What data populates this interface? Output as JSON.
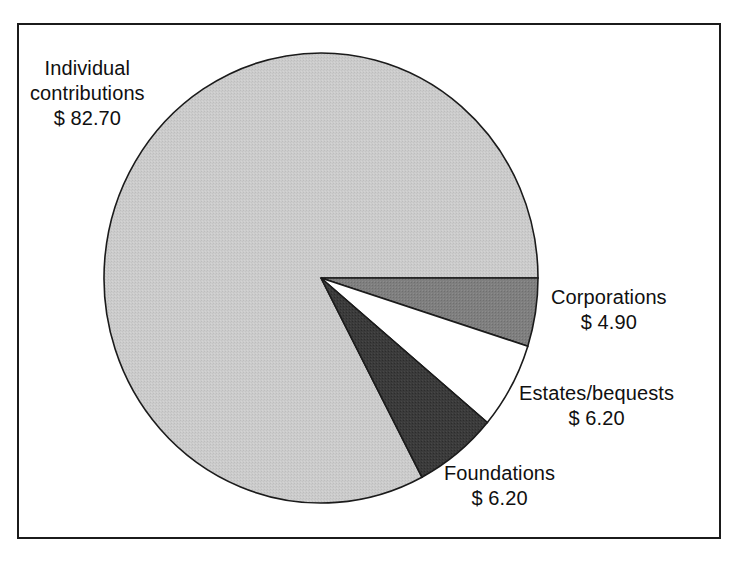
{
  "figure": {
    "background_color": "#ffffff",
    "border_color": "#1b1b1b"
  },
  "chart_data": {
    "type": "pie",
    "title": "",
    "subtitle": "",
    "xlabel": "",
    "ylabel": "",
    "grid": false,
    "legend_position": "none",
    "units": "$ (billions)",
    "total": 100.0,
    "start_angle_deg": 0,
    "direction": "clockwise",
    "categories": [
      "Individual contributions",
      "Corporations",
      "Estates/bequests",
      "Foundations"
    ],
    "values": [
      82.7,
      4.9,
      6.2,
      6.2
    ],
    "value_labels": [
      "$ 82.70",
      "$ 4.90",
      "$ 6.20",
      "$ 6.20"
    ],
    "colors": [
      "#c9c9c9",
      "#7f7f7f",
      "#ffffff",
      "#3b3b3b"
    ],
    "slices": [
      {
        "name": "Individual contributions",
        "value": 82.7,
        "value_label": "$ 82.70",
        "percent": 82.7,
        "color": "#c9c9c9",
        "label_line1": "Individual",
        "label_line2": "contributions",
        "label_line3": "$ 82.70"
      },
      {
        "name": "Corporations",
        "value": 4.9,
        "value_label": "$ 4.90",
        "percent": 4.9,
        "color": "#7f7f7f",
        "label_line1": "Corporations",
        "label_line2": "$ 4.90"
      },
      {
        "name": "Estates/bequests",
        "value": 6.2,
        "value_label": "$ 6.20",
        "percent": 6.2,
        "color": "#ffffff",
        "label_line1": "Estates/bequests",
        "label_line2": "$ 6.20"
      },
      {
        "name": "Foundations",
        "value": 6.2,
        "value_label": "$ 6.20",
        "percent": 6.2,
        "color": "#3b3b3b",
        "label_line1": "Foundations",
        "label_line2": "$ 6.20"
      }
    ]
  }
}
